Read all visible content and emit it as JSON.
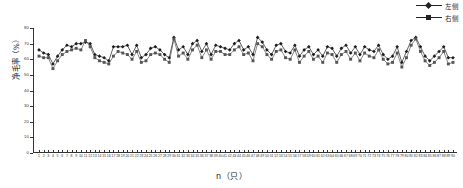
{
  "chart_data": {
    "type": "line",
    "title": "",
    "xlabel": "n（只）",
    "ylabel": "净毛率（%）",
    "ylim": [
      0,
      80
    ],
    "yticks": [
      0,
      10,
      20,
      30,
      40,
      50,
      60,
      70,
      80
    ],
    "ytick_labels": [
      "0",
      "10",
      "20",
      "30",
      "40",
      "50",
      "60",
      "70",
      "80"
    ],
    "grid": false,
    "legend_position": "top-right",
    "x": [
      1,
      2,
      3,
      4,
      5,
      6,
      7,
      8,
      9,
      10,
      11,
      12,
      13,
      14,
      15,
      16,
      17,
      18,
      19,
      20,
      21,
      22,
      23,
      24,
      25,
      26,
      27,
      28,
      29,
      30,
      31,
      32,
      33,
      34,
      35,
      36,
      37,
      38,
      39,
      40,
      41,
      42,
      43,
      44,
      45,
      46,
      47,
      48,
      49,
      50,
      51,
      52,
      53,
      54,
      55,
      56,
      57,
      58,
      59,
      60,
      61,
      62,
      63,
      64,
      65,
      66,
      67,
      68,
      69,
      70,
      71,
      72,
      73,
      74,
      75,
      76,
      77,
      78,
      79,
      80,
      81,
      82,
      83,
      84,
      85,
      86,
      87,
      88,
      89,
      90
    ],
    "xtick_labels": [
      "1",
      "2",
      "3",
      "4",
      "5",
      "6",
      "7",
      "8",
      "9",
      "10",
      "11",
      "12",
      "13",
      "14",
      "15",
      "16",
      "17",
      "18",
      "19",
      "20",
      "21",
      "22",
      "23",
      "24",
      "25",
      "26",
      "27",
      "28",
      "29",
      "30",
      "31",
      "32",
      "33",
      "34",
      "35",
      "36",
      "37",
      "38",
      "39",
      "40",
      "41",
      "42",
      "43",
      "44",
      "45",
      "46",
      "47",
      "48",
      "49",
      "50",
      "51",
      "52",
      "53",
      "54",
      "55",
      "56",
      "57",
      "58",
      "59",
      "60",
      "61",
      "62",
      "63",
      "64",
      "65",
      "66",
      "67",
      "68",
      "69",
      "70",
      "71",
      "72",
      "73",
      "74",
      "75",
      "76",
      "77",
      "78",
      "79",
      "80",
      "81",
      "82",
      "83",
      "84",
      "85",
      "86",
      "87",
      "88",
      "89",
      "90"
    ],
    "series": [
      {
        "name": "左侧",
        "marker": "diamond",
        "color": "#1c1c1c",
        "values": [
          66,
          64,
          63,
          57,
          62,
          66,
          69,
          68,
          70,
          70,
          71,
          70,
          63,
          62,
          61,
          59,
          68,
          68,
          68,
          69,
          63,
          69,
          61,
          63,
          67,
          68,
          66,
          63,
          61,
          74,
          66,
          68,
          63,
          70,
          72,
          65,
          70,
          63,
          69,
          68,
          67,
          66,
          70,
          72,
          66,
          68,
          63,
          74,
          71,
          66,
          63,
          69,
          70,
          65,
          64,
          69,
          62,
          66,
          68,
          63,
          66,
          62,
          68,
          67,
          62,
          67,
          69,
          64,
          68,
          63,
          68,
          66,
          65,
          69,
          63,
          60,
          62,
          68,
          58,
          65,
          72,
          74,
          68,
          62,
          59,
          62,
          65,
          68,
          61,
          61
        ]
      },
      {
        "name": "右侧",
        "marker": "square",
        "color": "#555555",
        "values": [
          62,
          61,
          61,
          54,
          59,
          63,
          65,
          66,
          67,
          66,
          72,
          68,
          61,
          59,
          58,
          57,
          62,
          65,
          64,
          63,
          60,
          65,
          58,
          59,
          63,
          64,
          63,
          60,
          58,
          73,
          62,
          64,
          60,
          66,
          69,
          61,
          66,
          60,
          65,
          65,
          63,
          63,
          66,
          68,
          63,
          64,
          59,
          70,
          68,
          63,
          60,
          65,
          66,
          61,
          60,
          66,
          58,
          62,
          65,
          60,
          62,
          58,
          64,
          63,
          58,
          63,
          65,
          60,
          64,
          59,
          64,
          62,
          61,
          66,
          60,
          57,
          58,
          64,
          55,
          61,
          69,
          73,
          65,
          59,
          56,
          58,
          61,
          65,
          57,
          58
        ]
      }
    ]
  },
  "legend": {
    "items": [
      {
        "label": "左侧",
        "marker": "diamond"
      },
      {
        "label": "右侧",
        "marker": "square"
      }
    ]
  }
}
